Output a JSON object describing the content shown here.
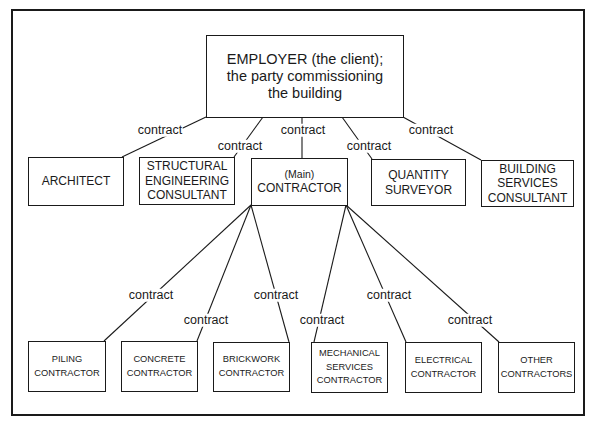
{
  "diagram": {
    "type": "organization-chart",
    "root": {
      "id": "employer",
      "lines": [
        "EMPLOYER (the client);",
        "the party commissioning",
        "the building"
      ]
    },
    "connector_label": "contract",
    "tier1": [
      {
        "id": "architect",
        "lines": [
          "ARCHITECT"
        ],
        "edge_label": "contract"
      },
      {
        "id": "structural",
        "lines": [
          "STRUCTURAL",
          "ENGINEERING",
          "CONSULTANT"
        ],
        "edge_label": "contract"
      },
      {
        "id": "main-contractor",
        "lines": [
          "(Main)",
          "CONTRACTOR"
        ],
        "edge_label": "contract"
      },
      {
        "id": "quantity-surveyor",
        "lines": [
          "QUANTITY",
          "SURVEYOR"
        ],
        "edge_label": "contract"
      },
      {
        "id": "building-services",
        "lines": [
          "BUILDING",
          "SERVICES",
          "CONSULTANT"
        ],
        "edge_label": "contract"
      }
    ],
    "tier2_parent": "main-contractor",
    "tier2": [
      {
        "id": "piling",
        "lines": [
          "PILING",
          "CONTRACTOR"
        ],
        "edge_label": "contract"
      },
      {
        "id": "concrete",
        "lines": [
          "CONCRETE",
          "CONTRACTOR"
        ],
        "edge_label": "contract"
      },
      {
        "id": "brickwork",
        "lines": [
          "BRICKWORK",
          "CONTRACTOR"
        ],
        "edge_label": "contract"
      },
      {
        "id": "mechanical",
        "lines": [
          "MECHANICAL",
          "SERVICES",
          "CONTRACTOR"
        ],
        "edge_label": "contract"
      },
      {
        "id": "electrical",
        "lines": [
          "ELECTRICAL",
          "CONTRACTOR"
        ],
        "edge_label": "contract"
      },
      {
        "id": "other",
        "lines": [
          "OTHER",
          "CONTRACTORS"
        ],
        "edge_label": "contract"
      }
    ],
    "colors": {
      "stroke": "#1a1a1a",
      "background": "#ffffff"
    }
  }
}
